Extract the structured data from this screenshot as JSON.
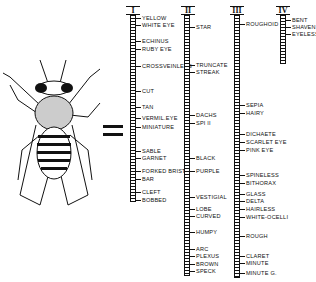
{
  "diagram": {
    "equals_sign": "=",
    "chromosomes": [
      {
        "name": "I",
        "genes": [
          "YELLOW",
          "WHITE EYE",
          "ECHINUS",
          "RUBY EYE",
          "CROSSVEINLESS",
          "CUT",
          "TAN",
          "VERMIL.EYE",
          "MINIATURE",
          "SABLE",
          "GARNET",
          "FORKED BRIST.",
          "BAR",
          "CLEFT",
          "BOBBED"
        ]
      },
      {
        "name": "II",
        "genes": [
          "STAR",
          "TRUNCATE",
          "STREAK",
          "DACHS",
          "SPI II",
          "BLACK",
          "PURPLE",
          "VESTIGIAL",
          "LOBE",
          "CURVED",
          "HUMPY",
          "ARC",
          "PLEXUS",
          "BROWN",
          "SPECK"
        ]
      },
      {
        "name": "III",
        "genes": [
          "ROUGHOID",
          "SEPIA",
          "HAIRY",
          "DICHAETE",
          "SCARLET EYE",
          "PINK EYE",
          "SPINELESS",
          "BITHORAX",
          "GLASS",
          "DELTA",
          "HAIRLESS",
          "WHITE-OCELLI",
          "ROUGH",
          "CLARET",
          "MINUTE",
          "MINUTE G."
        ]
      },
      {
        "name": "IV",
        "genes": [
          "BENT",
          "SHAVEN",
          "EYELESS"
        ]
      }
    ]
  }
}
